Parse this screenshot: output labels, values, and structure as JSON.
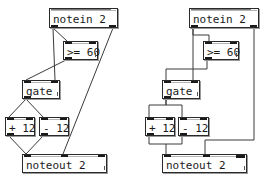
{
  "colors": {
    "cord": "#3a3a3a",
    "box_border": "#2a2a2a",
    "background": "#ffffff"
  },
  "patches": [
    {
      "id": "left",
      "objects": {
        "notein": "notein 2",
        "compare": ">= 60",
        "gate": "gate",
        "plus": "+ 12",
        "minus": "- 12",
        "noteout": "noteout 2"
      }
    },
    {
      "id": "right",
      "objects": {
        "notein": "notein 2",
        "compare": ">= 60",
        "gate": "gate",
        "plus": "+ 12",
        "minus": "- 12",
        "noteout": "noteout 2"
      }
    }
  ]
}
